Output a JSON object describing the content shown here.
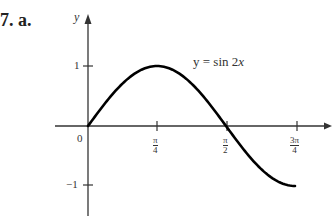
{
  "problem_label": "7. a.",
  "chart_data": {
    "type": "line",
    "title": "",
    "function_label": "y = sin 2x",
    "xlabel": "",
    "ylabel": "y",
    "x": [
      0,
      0.3927,
      0.7854,
      1.1781,
      1.5708,
      1.9635,
      2.3562
    ],
    "y": [
      0,
      0.7071,
      1,
      0.7071,
      0,
      -0.7071,
      -1
    ],
    "x_domain": [
      0,
      2.3562
    ],
    "xticks": [
      "0",
      "π/4",
      "π/2",
      "3π/4"
    ],
    "yticks": [
      "1",
      "−1"
    ],
    "ylim": [
      -1.2,
      1.6
    ],
    "grid": false,
    "legend": "none"
  },
  "labels": {
    "y_axis": "y",
    "equation_prefix": "y = sin 2",
    "equation_var": "x",
    "origin": "0",
    "y_one": "1",
    "y_neg_one": "−1",
    "x_pi4_num": "π",
    "x_pi4_den": "4",
    "x_pi2_num": "π",
    "x_pi2_den": "2",
    "x_3pi4_num": "3π",
    "x_3pi4_den": "4"
  }
}
